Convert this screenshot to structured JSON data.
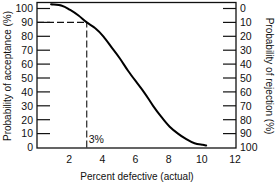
{
  "chart_data": {
    "type": "line",
    "title": "",
    "xlabel": "Percent defective (actual)",
    "ylabel": "Probability of acceptance (%)",
    "y2label": "Probability of rejection (%)",
    "xlim": [
      0,
      12
    ],
    "ylim": [
      0,
      100
    ],
    "y2lim": [
      100,
      0
    ],
    "x_ticks": [
      2,
      4,
      6,
      8,
      10,
      12
    ],
    "y_ticks": [
      0,
      10,
      20,
      30,
      40,
      50,
      60,
      70,
      80,
      90,
      100
    ],
    "y2_ticks": [
      100,
      90,
      80,
      70,
      60,
      50,
      40,
      30,
      20,
      10,
      0
    ],
    "grid": false,
    "legend": null,
    "series": [
      {
        "name": "Operating characteristic curve",
        "x": [
          0.85,
          1.5,
          2.0,
          2.5,
          3.0,
          3.5,
          4.0,
          4.5,
          5.0,
          5.5,
          6.0,
          6.5,
          7.0,
          7.5,
          8.0,
          8.5,
          9.0,
          9.5,
          10.0,
          10.2
        ],
        "values": [
          103,
          102,
          99,
          95,
          90,
          86,
          80,
          72,
          64,
          55,
          47,
          39,
          30,
          22,
          15,
          10,
          6,
          3,
          2,
          1.5
        ]
      }
    ],
    "annotations": [
      {
        "type": "dashed-hline",
        "y": 90,
        "x_from": 0,
        "x_to": 3
      },
      {
        "type": "dashed-vline",
        "x": 3,
        "y_from": 0,
        "y_to": 90
      },
      {
        "type": "text",
        "text": "3%",
        "x": 3,
        "y": 5
      }
    ]
  }
}
